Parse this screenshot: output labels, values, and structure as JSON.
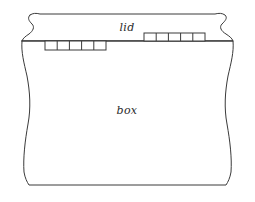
{
  "diagram": {
    "type": "line-drawing",
    "stroke_color": "#3a3a3a",
    "fill_color": "#ffffff",
    "background": "#ffffff",
    "labels": {
      "lid": "lid",
      "box": "box"
    },
    "label_positions": {
      "lid": {
        "x": 127,
        "y": 31
      },
      "box": {
        "x": 127,
        "y": 114
      }
    },
    "regions": [
      {
        "name": "lid",
        "label": "lid",
        "top_y": 14,
        "bottom_y": 41,
        "description": "upper band with wavy break lines at left and right"
      },
      {
        "name": "box",
        "label": "box",
        "top_y": 41,
        "bottom_y": 185,
        "description": "lower body with wavy break lines at left and right"
      }
    ],
    "divider": {
      "name": "lid-box-seam",
      "y": 41,
      "x_start": 22,
      "x_end": 233
    },
    "joint_groups": [
      {
        "name": "left-finger-joint",
        "side": "below",
        "x_start": 45,
        "x_end": 106,
        "y_top": 41,
        "y_bottom": 50,
        "cells": 5,
        "cell_boundaries": [
          45,
          57,
          70,
          82,
          94,
          106
        ]
      },
      {
        "name": "right-finger-joint",
        "side": "above",
        "x_start": 144,
        "x_end": 205,
        "y_top": 33,
        "y_bottom": 41,
        "cells": 5,
        "cell_boundaries": [
          144,
          156,
          168,
          181,
          193,
          205
        ]
      }
    ],
    "break_edges": [
      {
        "name": "left-break-edge",
        "side": "left"
      },
      {
        "name": "right-break-edge",
        "side": "right"
      }
    ]
  }
}
